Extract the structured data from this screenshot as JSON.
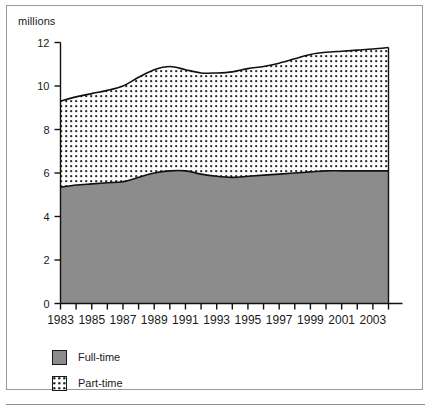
{
  "figure": {
    "unit_label": "millions",
    "frame_color": "#9a9a9a",
    "axis_color": "#1a1a1a"
  },
  "legend": {
    "position": "bottom-left",
    "items": [
      {
        "label": "Full-time",
        "swatch": "solid-gray-swatch",
        "color": "#8c8c8c"
      },
      {
        "label": "Part-time",
        "swatch": "dotted-pattern-swatch",
        "color": "#ffffff"
      }
    ]
  },
  "chart_data": {
    "type": "area",
    "stacked": true,
    "title": "",
    "subtitle": "",
    "xlabel": "",
    "ylabel": "millions",
    "ylim": [
      0,
      12
    ],
    "xlim": [
      1983,
      2004
    ],
    "grid": false,
    "ytick_labels": [
      "0",
      "2",
      "4",
      "6",
      "8",
      "10",
      "12"
    ],
    "yticks": [
      0,
      2,
      4,
      6,
      8,
      10,
      12
    ],
    "xtick_labels": [
      "1983",
      "1985",
      "1987",
      "1989",
      "1991",
      "1993",
      "1995",
      "1997",
      "1999",
      "2001",
      "2003"
    ],
    "xticks": [
      1983,
      1985,
      1987,
      1989,
      1991,
      1993,
      1995,
      1997,
      1999,
      2001,
      2003
    ],
    "x_minor_ticks": [
      1984,
      1986,
      1988,
      1990,
      1992,
      1994,
      1996,
      1998,
      2000,
      2002,
      2004
    ],
    "x": [
      1983,
      1984,
      1985,
      1986,
      1987,
      1988,
      1989,
      1990,
      1991,
      1992,
      1993,
      1994,
      1995,
      1996,
      1997,
      1998,
      1999,
      2000,
      2001,
      2002,
      2003,
      2004
    ],
    "series": [
      {
        "name": "Full-time",
        "color": "#8c8c8c",
        "pattern": "solid",
        "values": [
          5.35,
          5.45,
          5.5,
          5.55,
          5.6,
          5.8,
          6.0,
          6.1,
          6.1,
          5.95,
          5.85,
          5.8,
          5.85,
          5.9,
          5.95,
          6.0,
          6.05,
          6.1,
          6.1,
          6.1,
          6.1,
          6.1
        ]
      },
      {
        "name": "Part-time",
        "color": "#ffffff",
        "pattern": "dotted",
        "values": [
          3.95,
          4.05,
          4.15,
          4.25,
          4.4,
          4.6,
          4.75,
          4.8,
          4.65,
          4.65,
          4.75,
          4.85,
          4.95,
          5.0,
          5.1,
          5.25,
          5.4,
          5.45,
          5.5,
          5.55,
          5.6,
          5.67
        ]
      }
    ],
    "totals": [
      9.3,
      9.5,
      9.65,
      9.8,
      10.0,
      10.4,
      10.75,
      10.9,
      10.75,
      10.6,
      10.6,
      10.65,
      10.8,
      10.9,
      11.05,
      11.25,
      11.45,
      11.55,
      11.6,
      11.65,
      11.7,
      11.77
    ]
  }
}
